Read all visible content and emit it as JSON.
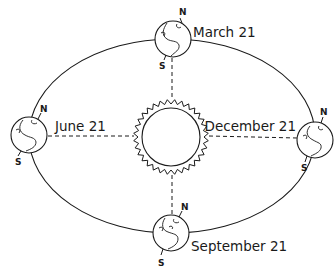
{
  "diagram": {
    "type": "earth-orbit-seasons",
    "colors": {
      "line": "#1a1a1a",
      "background": "#ffffff"
    },
    "sun": {
      "label": "",
      "icon": "sun-icon"
    },
    "orbit": {
      "icon": "ellipse-orbit"
    },
    "positions": [
      {
        "id": "top",
        "label": "March 21",
        "north": "N",
        "south": "S"
      },
      {
        "id": "left",
        "label": "June 21",
        "north": "N",
        "south": "S"
      },
      {
        "id": "right",
        "label": "December 21",
        "north": "N",
        "south": "S"
      },
      {
        "id": "bottom",
        "label": "September 21",
        "north": "N",
        "south": "S"
      }
    ]
  }
}
